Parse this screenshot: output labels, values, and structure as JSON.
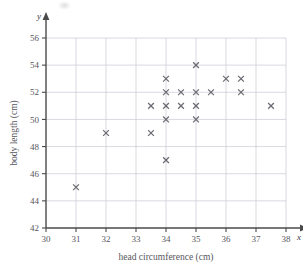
{
  "chart_data": {
    "type": "scatter",
    "title": "",
    "xlabel": "head circumference (cm)",
    "ylabel": "body length (cm)",
    "x_var": "x",
    "y_var": "y",
    "xlim": [
      30,
      38
    ],
    "ylim": [
      42,
      56
    ],
    "x_ticks": [
      30,
      31,
      32,
      33,
      34,
      35,
      36,
      37,
      38
    ],
    "y_ticks": [
      42,
      44,
      46,
      48,
      50,
      52,
      54,
      56
    ],
    "x_tick_labels": [
      "30",
      "31",
      "32",
      "33",
      "34",
      "35",
      "36",
      "37",
      "38"
    ],
    "y_tick_labels": [
      "42",
      "44",
      "46",
      "48",
      "50",
      "52",
      "54",
      "56"
    ],
    "grid": true,
    "legend": "none",
    "marker": "x",
    "marker_color": "#6a6a72",
    "grid_color": "#c9c9d2",
    "axis_color": "#4a4a4a",
    "points": [
      [
        31,
        45
      ],
      [
        32,
        49
      ],
      [
        33.5,
        49
      ],
      [
        33.5,
        51
      ],
      [
        34,
        47
      ],
      [
        34,
        50
      ],
      [
        34,
        51
      ],
      [
        34,
        52
      ],
      [
        34,
        53
      ],
      [
        34.5,
        51
      ],
      [
        34.5,
        52
      ],
      [
        35,
        50
      ],
      [
        35,
        51
      ],
      [
        35,
        52
      ],
      [
        35,
        54
      ],
      [
        35.5,
        52
      ],
      [
        36,
        53
      ],
      [
        36.5,
        52
      ],
      [
        36.5,
        53
      ],
      [
        37.5,
        51
      ]
    ],
    "n_points": 20
  }
}
